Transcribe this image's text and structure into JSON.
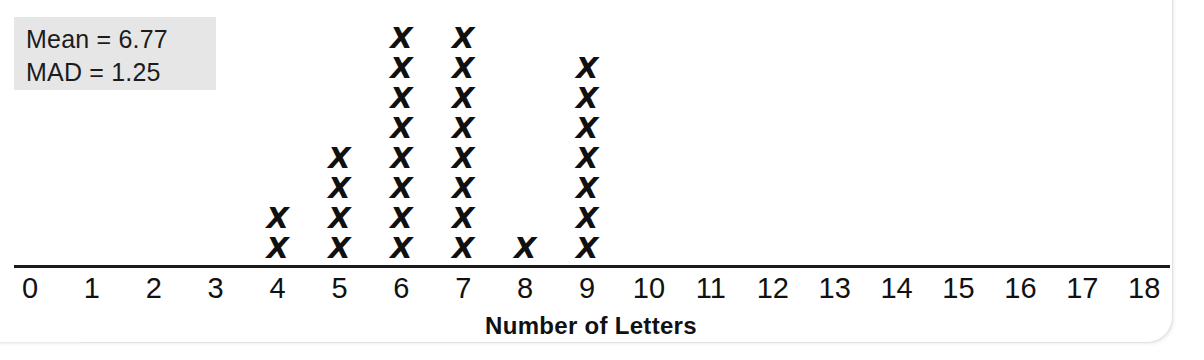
{
  "stats": {
    "mean_line": "Mean = 6.77",
    "mad_line": "MAD = 1.25"
  },
  "chart_data": {
    "type": "bar",
    "title": "",
    "subtitle": "",
    "xlabel": "Number of Letters",
    "ylabel": "",
    "plot_style": "dot-plot",
    "marker": "X",
    "grid": false,
    "legend": null,
    "xlim": [
      0,
      18
    ],
    "xtick_step": 1,
    "categories": [
      0,
      1,
      2,
      3,
      4,
      5,
      6,
      7,
      8,
      9,
      10,
      11,
      12,
      13,
      14,
      15,
      16,
      17,
      18
    ],
    "tick_labels": [
      "0",
      "1",
      "2",
      "3",
      "4",
      "5",
      "6",
      "7",
      "8",
      "9",
      "10",
      "11",
      "12",
      "13",
      "14",
      "15",
      "16",
      "17",
      "18"
    ],
    "values": [
      0,
      0,
      0,
      0,
      2,
      4,
      8,
      8,
      1,
      7,
      0,
      0,
      0,
      0,
      0,
      0,
      0,
      0,
      0
    ],
    "total_count": 30,
    "annotations": [
      "Mean = 6.77",
      "MAD = 1.25"
    ]
  },
  "colors": {
    "ink": "#111111",
    "axis": "#1a1a1a",
    "stats_box_background": "#e6e6e6",
    "page_background": "#ffffff"
  }
}
